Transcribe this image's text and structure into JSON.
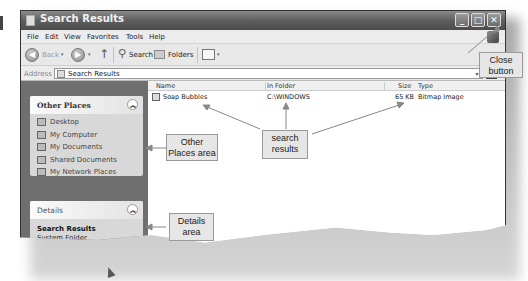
{
  "window": {
    "title": "Search Results",
    "controls": {
      "minimize": "_",
      "maximize": "□",
      "close": "✕"
    }
  },
  "menubar": {
    "items": [
      "File",
      "Edit",
      "View",
      "Favorites",
      "Tools",
      "Help"
    ]
  },
  "toolbar": {
    "back_label": "Back",
    "search_label": "Search",
    "folders_label": "Folders",
    "back_icon": "◀",
    "forward_icon": "▶",
    "up_icon": "↑",
    "dropdown_icon": "▾"
  },
  "addressbar": {
    "label": "Address",
    "value": "Search Results",
    "dropdown_icon": "▾"
  },
  "sidebar": {
    "other_places": {
      "title": "Other Places",
      "collapse_icon": "︽",
      "items": [
        "Desktop",
        "My Computer",
        "My Documents",
        "Shared Documents",
        "My Network Places"
      ]
    },
    "details": {
      "title": "Details",
      "collapse_icon": "︽",
      "name": "Search Results",
      "subtitle": "System Folder"
    }
  },
  "results": {
    "columns": [
      "Name",
      "In Folder",
      "Size",
      "Type"
    ],
    "rows": [
      {
        "name": "Soap Bubbles",
        "folder": "C:\\WINDOWS",
        "size": "65 KB",
        "type": "Bitmap Image"
      }
    ]
  },
  "callouts": {
    "close_button": [
      "Close",
      "button"
    ],
    "other_places": [
      "Other",
      "Places area"
    ],
    "search_results": [
      "search",
      "results"
    ],
    "details_area": [
      "Details",
      "area"
    ]
  }
}
